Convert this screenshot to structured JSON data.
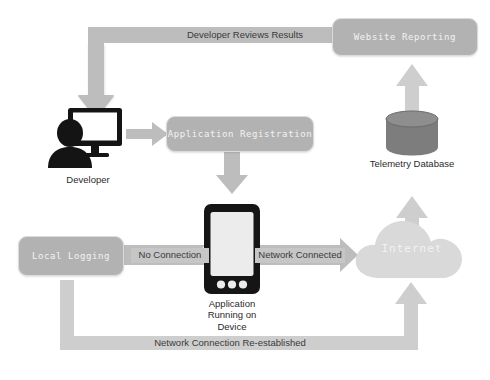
{
  "diagram": {
    "background_color": "#ffffff",
    "arrow_color": "#bdbdbd",
    "box_fill": "#b2b2b2",
    "box_text_color": "#f2f2f2",
    "icon_dark": "#1a1a1a",
    "cloud_fill": "#d8d8d8",
    "database_fill": "#7a7a7a"
  },
  "boxes": {
    "website_reporting": "Website Reporting",
    "application_registration": "Application Registration",
    "local_logging": "Local Logging"
  },
  "nodes": {
    "developer": "Developer",
    "telemetry_database": "Telemetry Database",
    "internet": "Internet",
    "device_line1": "Application",
    "device_line2": "Running on",
    "device_line3": "Device"
  },
  "edges": {
    "developer_reviews_results": "Developer Reviews Results",
    "no_connection": "No Connection",
    "network_connected": "Network Connected",
    "network_connection_reestablished": "Network Connection Re-established"
  }
}
